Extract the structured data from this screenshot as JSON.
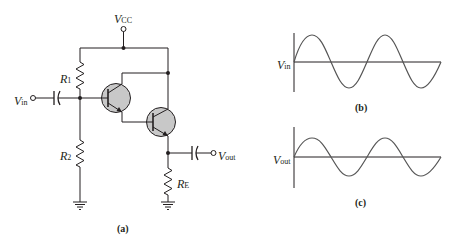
{
  "figure": {
    "panel_a": {
      "caption": "(a)",
      "labels": {
        "vcc": {
          "main": "V",
          "sub": "CC"
        },
        "vin": {
          "main": "V",
          "sub": "in"
        },
        "vout": {
          "main": "V",
          "sub": "out"
        },
        "r1": {
          "main": "R",
          "sub": "1"
        },
        "r2": {
          "main": "R",
          "sub": "2"
        },
        "re": {
          "main": "R",
          "sub": "E"
        }
      },
      "components": [
        "Q1 NPN transistor",
        "Q2 NPN transistor",
        "R1",
        "R2",
        "RE",
        "input coupling capacitor",
        "output coupling capacitor",
        "ground",
        "ground"
      ],
      "description": "Darlington emitter-follower amplifier"
    },
    "panel_b": {
      "caption": "(b)",
      "label": {
        "main": "V",
        "sub": "in"
      },
      "waveform": "sine",
      "cycles": 2
    },
    "panel_c": {
      "caption": "(c)",
      "label": {
        "main": "V",
        "sub": "out"
      },
      "waveform": "sine",
      "cycles": 2
    }
  },
  "colors": {
    "line": "#231f20",
    "transistor_fill": "#c8c8c8",
    "wave": "#555555"
  }
}
